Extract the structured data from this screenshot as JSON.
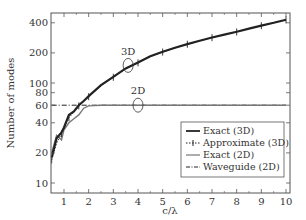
{
  "chart_data": {
    "type": "line",
    "title": "",
    "xlabel": "c/λ",
    "ylabel": "Number of modes",
    "xlim": [
      0.5,
      10
    ],
    "ylim": [
      10,
      480
    ],
    "yscale": "log",
    "x_ticks": [
      "1",
      "2",
      "3",
      "4",
      "5",
      "6",
      "7",
      "8",
      "9",
      "10"
    ],
    "y_ticks": [
      "10",
      "20",
      "40",
      "60",
      "80",
      "100",
      "200",
      "400"
    ],
    "grid": false,
    "legend_position": "lower right",
    "legend": [
      "Exact (3D)",
      "Approximate (3D)",
      "Exact (2D)",
      "Waveguide (2D)"
    ],
    "annotations": [
      {
        "text": "3D",
        "x": 3.6,
        "y": 150
      },
      {
        "text": "2D",
        "x": 4.0,
        "y": 60
      }
    ],
    "series": [
      {
        "name": "Exact (3D)",
        "style": "solid-thick",
        "color": "#222222",
        "x": [
          0.5,
          0.7,
          0.9,
          1.0,
          1.2,
          1.4,
          1.6,
          1.8,
          2.0,
          2.5,
          3.0,
          3.5,
          4.0,
          4.5,
          5.0,
          5.5,
          6.0,
          6.5,
          7.0,
          7.5,
          8.0,
          8.5,
          9.0,
          9.5,
          10.0
        ],
        "y": [
          18,
          28,
          32,
          36,
          48,
          52,
          60,
          66,
          74,
          95,
          115,
          140,
          160,
          185,
          205,
          225,
          245,
          265,
          285,
          305,
          325,
          350,
          375,
          400,
          430
        ]
      },
      {
        "name": "Approximate (3D)",
        "style": "dotted-plus",
        "color": "#222222",
        "x": [
          0.5,
          0.7,
          0.9,
          1.0,
          1.2,
          1.4,
          1.6,
          1.8,
          2.0,
          2.5,
          3.0,
          3.5,
          4.0,
          4.5,
          5.0,
          5.5,
          6.0,
          6.5,
          7.0,
          7.5,
          8.0,
          8.5,
          9.0,
          9.5,
          10.0
        ],
        "y": [
          17,
          25,
          31,
          35,
          45,
          51,
          59,
          66,
          73,
          94,
          114,
          139,
          159,
          184,
          204,
          224,
          244,
          264,
          284,
          304,
          324,
          349,
          374,
          399,
          428
        ]
      },
      {
        "name": "Exact (2D)",
        "style": "solid-gray",
        "color": "#777777",
        "x": [
          0.5,
          0.7,
          0.9,
          1.0,
          1.2,
          1.4,
          1.6,
          1.8,
          2.0,
          2.5,
          3.0,
          4.0,
          5.0,
          6.0,
          7.0,
          8.0,
          9.0,
          10.0
        ],
        "y": [
          20,
          30,
          27,
          34,
          40,
          44,
          48,
          56,
          59,
          60,
          60,
          60,
          60,
          60,
          60,
          60,
          60,
          60
        ]
      },
      {
        "name": "Waveguide (2D)",
        "style": "dash-dot",
        "color": "#222222",
        "x": [
          0.5,
          10.0
        ],
        "y": [
          60,
          60
        ]
      }
    ]
  }
}
